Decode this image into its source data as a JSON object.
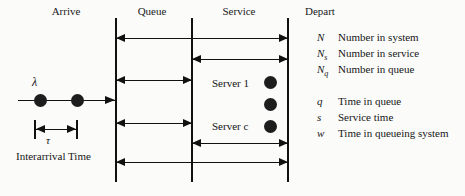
{
  "diagram": {
    "columns": [
      {
        "key": "arrive",
        "label": "Arrive"
      },
      {
        "key": "queue",
        "label": "Queue"
      },
      {
        "key": "service",
        "label": "Service"
      },
      {
        "key": "depart",
        "label": "Depart"
      }
    ],
    "arrival": {
      "rate_symbol": "λ",
      "interarrival_symbol": "τ",
      "interarrival_label": "Interarrival Time",
      "entity_count": 2
    },
    "servers": [
      {
        "label": "Server 1"
      },
      {
        "label": ""
      },
      {
        "label": "Server c"
      }
    ],
    "measures": [
      {
        "name": "number-in-system",
        "span": "full",
        "direction": "both"
      },
      {
        "name": "number-in-service",
        "span": "service",
        "direction": "both"
      },
      {
        "name": "number-in-queue",
        "span": "queue",
        "direction": "both"
      },
      {
        "name": "time-in-queue",
        "span": "queue",
        "direction": "both"
      },
      {
        "name": "service-time",
        "span": "service",
        "direction": "both"
      },
      {
        "name": "time-in-system",
        "span": "full",
        "direction": "both"
      }
    ],
    "legend": {
      "heading": "Depart",
      "groups": [
        {
          "name": "counts",
          "entries": [
            {
              "symbol": "N",
              "subscript": "",
              "description": "Number in system"
            },
            {
              "symbol": "N",
              "subscript": "s",
              "description": "Number in service"
            },
            {
              "symbol": "N",
              "subscript": "q",
              "description": "Number in queue"
            }
          ]
        },
        {
          "name": "times",
          "entries": [
            {
              "symbol": "q",
              "subscript": "",
              "description": "Time in queue"
            },
            {
              "symbol": "s",
              "subscript": "",
              "description": "Service time"
            },
            {
              "symbol": "w",
              "subscript": "",
              "description": "Time in queueing system"
            }
          ]
        }
      ]
    },
    "colors": {
      "ink": "#111111",
      "background": "#fbfbfa",
      "entity_fill": "#1d1d1d"
    }
  }
}
